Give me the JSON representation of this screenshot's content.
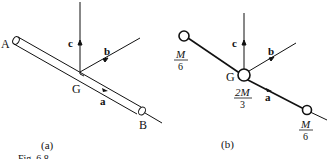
{
  "figure": {
    "caption": "Fig. 6.8",
    "panel_a": {
      "label": "(a)",
      "end_a": "A",
      "end_b": "B",
      "center": "G",
      "axis_a": "a",
      "axis_b": "b",
      "axis_c": "c"
    },
    "panel_b": {
      "label": "(b)",
      "center": "G",
      "axis_a": "a",
      "axis_b": "b",
      "axis_c": "c",
      "mass_left_num": "M",
      "mass_left_den": "6",
      "mass_center_num": "2M",
      "mass_center_den": "3",
      "mass_right_num": "M",
      "mass_right_den": "6"
    }
  }
}
